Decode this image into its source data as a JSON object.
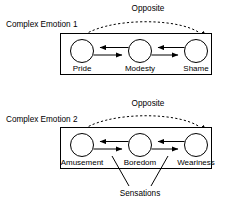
{
  "diagram": {
    "type": "concept-diagram",
    "background_color": "#ffffff",
    "stroke_color": "#000000",
    "groups": [
      {
        "id": "complex-emotion-1",
        "title": "Complex Emotion 1",
        "relation_label": "Opposite",
        "nodes": [
          {
            "id": "pride",
            "label": "Pride"
          },
          {
            "id": "modesty",
            "label": "Modesty"
          },
          {
            "id": "shame",
            "label": "Shame"
          }
        ]
      },
      {
        "id": "complex-emotion-2",
        "title": "Complex Emotion 2",
        "relation_label": "Opposite",
        "annotation_label": "Sensations",
        "nodes": [
          {
            "id": "amusement",
            "label": "Amusement"
          },
          {
            "id": "boredom",
            "label": "Boredom"
          },
          {
            "id": "weariness",
            "label": "Weariness"
          }
        ]
      }
    ]
  }
}
